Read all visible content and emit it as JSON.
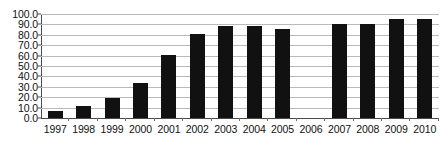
{
  "chart_data": {
    "type": "bar",
    "title": "",
    "xlabel": "",
    "ylabel": "",
    "categories": [
      "1997",
      "1998",
      "1999",
      "2000",
      "2001",
      "2002",
      "2003",
      "2004",
      "2005",
      "2006",
      "2007",
      "2008",
      "2009",
      "2010"
    ],
    "values": [
      7.0,
      11.5,
      19.0,
      33.5,
      60.5,
      80.5,
      88.5,
      88.5,
      85.5,
      null,
      90.5,
      90.5,
      95.5,
      95.5
    ],
    "ylim": [
      0.0,
      100.0
    ],
    "ytick_step": 10.0,
    "ytick_labels": [
      "100.0",
      "90.0",
      "80.0",
      "70.0",
      "60.0",
      "50.0",
      "40.0",
      "30.0",
      "20.0",
      "10.0",
      "0.0"
    ],
    "ytick_values": [
      100.0,
      90.0,
      80.0,
      70.0,
      60.0,
      50.0,
      40.0,
      30.0,
      20.0,
      10.0,
      0.0
    ],
    "grid": true,
    "legend": false,
    "legend_position": "none",
    "bar_color": "#111111",
    "grid_color": "#b9b9b9",
    "axis_color": "#4a4a4a"
  }
}
